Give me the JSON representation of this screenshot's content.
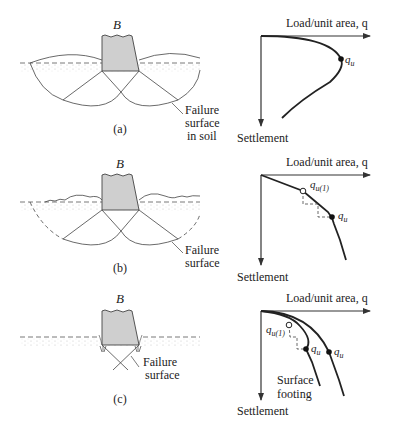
{
  "panels": [
    {
      "id": "a",
      "caption": "(a)",
      "footing_label": "B",
      "failure_label": [
        "Failure",
        "surface",
        "in soil"
      ],
      "mode": "general shear failure",
      "graph": {
        "x_axis_label": "Load/unit area, q",
        "y_axis_label": "Settlement",
        "points": [
          {
            "label": "q",
            "sub": "u",
            "marker": "filled"
          }
        ]
      }
    },
    {
      "id": "b",
      "caption": "(b)",
      "footing_label": "B",
      "failure_label": [
        "Failure",
        "surface"
      ],
      "mode": "local shear failure",
      "graph": {
        "x_axis_label": "Load/unit area, q",
        "y_axis_label": "Settlement",
        "points": [
          {
            "label": "q",
            "sub": "u(1)",
            "marker": "open"
          },
          {
            "label": "q",
            "sub": "u",
            "marker": "filled"
          }
        ]
      }
    },
    {
      "id": "c",
      "caption": "(c)",
      "footing_label": "B",
      "failure_label": [
        "Failure",
        "surface"
      ],
      "mode": "punching shear failure",
      "graph": {
        "x_axis_label": "Load/unit area, q",
        "y_axis_label": "Settlement",
        "curve_label": [
          "Surface",
          "footing"
        ],
        "points": [
          {
            "label": "q",
            "sub": "u(1)",
            "marker": "open"
          },
          {
            "label": "q",
            "sub": "u",
            "marker": "filled"
          },
          {
            "label": "q",
            "sub": "u",
            "marker": "filled"
          }
        ]
      }
    }
  ],
  "colors": {
    "footing_fill": "#cfcfcf",
    "line": "#333333",
    "text": "#222222"
  }
}
